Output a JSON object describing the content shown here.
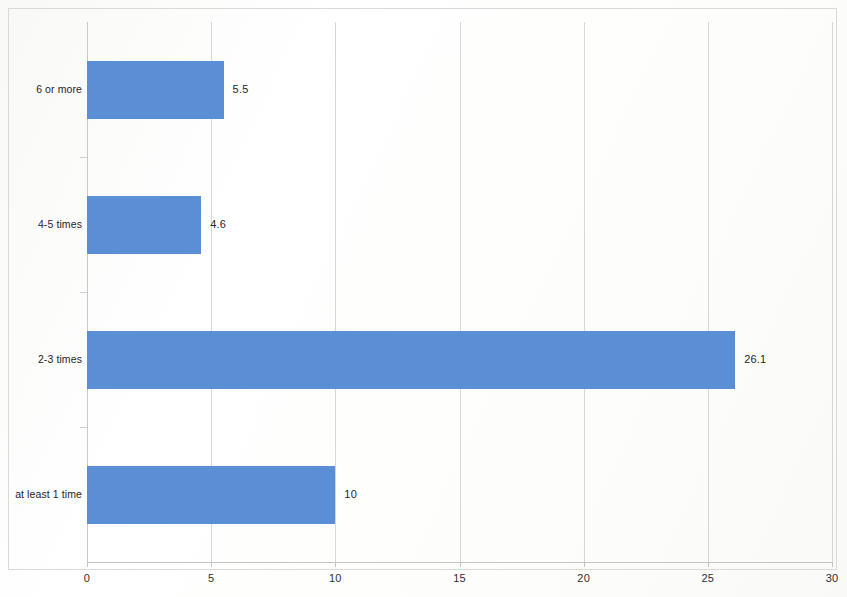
{
  "chart_data": {
    "type": "bar",
    "orientation": "horizontal",
    "title": "",
    "subtitle": "",
    "xlabel": "",
    "ylabel": "",
    "categories": [
      "6 or more",
      "4-5 times",
      "2-3 times",
      "at least 1 time"
    ],
    "values": [
      5.5,
      4.6,
      26.1,
      10
    ],
    "value_labels": [
      "5.5",
      "4.6",
      "26.1",
      "10"
    ],
    "series": [
      {
        "name": "",
        "values": [
          5.5,
          4.6,
          26.1,
          10
        ]
      }
    ],
    "xlim": [
      0,
      30
    ],
    "ylim": null,
    "x_ticks": [
      0,
      5,
      10,
      15,
      20,
      25,
      30
    ],
    "x_tick_labels": [
      "0",
      "5",
      "10",
      "15",
      "20",
      "25",
      "30"
    ],
    "grid": true,
    "grid_axis": "x",
    "legend": false,
    "legend_position": "none",
    "data_labels_shown": true,
    "bar_color": "#5b8fd5",
    "gridline_color": "#d6d6d6",
    "axis_color": "#c4c4c4",
    "plot_background": "#ffffff",
    "frame_color": "#d9d9d9"
  }
}
